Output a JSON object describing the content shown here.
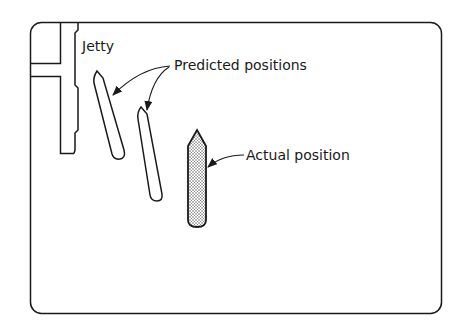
{
  "diagram": {
    "labels": {
      "jetty": "Jetty",
      "predicted": "Predicted positions",
      "actual": "Actual position"
    },
    "colors": {
      "stroke": "#1a1a1a",
      "background": "#ffffff",
      "stipple": "#9a9a9a"
    }
  }
}
